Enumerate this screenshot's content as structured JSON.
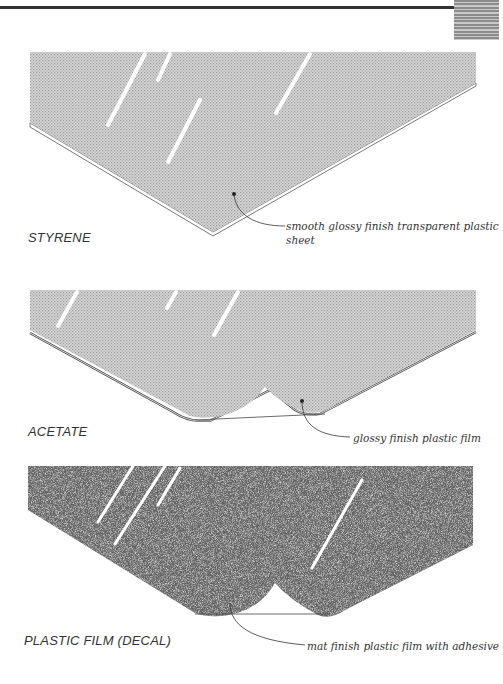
{
  "page": {
    "header_rule": true,
    "thumb_tab": "gray-striped-tab"
  },
  "figures": [
    {
      "id": "styrene",
      "label": "STYRENE",
      "caption": "smooth glossy finish transparent plastic sheet",
      "caption_line1": "smooth glossy finish transparent plastic",
      "caption_line2": "sheet",
      "texture": "fine-dot-gray",
      "fill_color": "#c8c8c8"
    },
    {
      "id": "acetate",
      "label": "ACETATE",
      "caption": "glossy finish plastic film",
      "texture": "fine-dot-gray",
      "fill_color": "#c3c3c3"
    },
    {
      "id": "decal",
      "label": "PLASTIC FILM (DECAL)",
      "caption": "mat finish plastic film with adhesive",
      "texture": "coarse-speckle",
      "fill_color": "#7a7a7a"
    }
  ]
}
